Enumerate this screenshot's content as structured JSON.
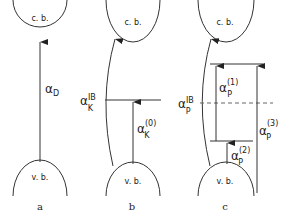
{
  "panels": [
    {
      "id": "a",
      "label": "a",
      "conduction_band": "c. b.",
      "valence_band": "v. b.",
      "transitions": [
        {
          "symbol": "α",
          "sub": "D",
          "sup": ""
        }
      ]
    },
    {
      "id": "b",
      "label": "b",
      "conduction_band": "c. b.",
      "valence_band": "v. b.",
      "transitions": [
        {
          "symbol": "α",
          "sub": "K",
          "sup": "IB"
        },
        {
          "symbol": "α",
          "sub": "K",
          "sup": "(0)"
        }
      ]
    },
    {
      "id": "c",
      "label": "c",
      "conduction_band": "c. b.",
      "valence_band": "v. b.",
      "transitions": [
        {
          "symbol": "α",
          "sub": "P",
          "sup": "IB"
        },
        {
          "symbol": "α",
          "sub": "P",
          "sup": "(1)"
        },
        {
          "symbol": "α",
          "sub": "P",
          "sup": "(2)"
        },
        {
          "symbol": "α",
          "sub": "P",
          "sup": "(3)"
        }
      ]
    }
  ],
  "colors": {
    "line": "#333333",
    "dashed": "#666666"
  }
}
